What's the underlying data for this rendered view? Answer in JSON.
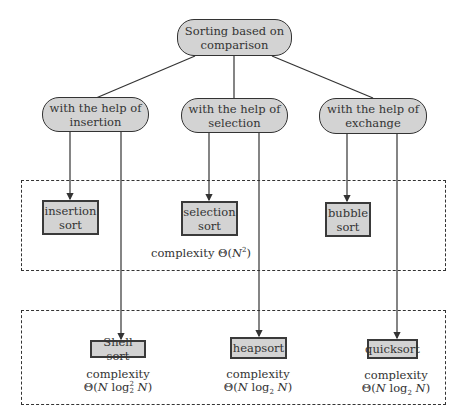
{
  "diagram": {
    "root": {
      "label_line1": "Sorting based on",
      "label_line2": "comparison"
    },
    "categories": [
      {
        "label_line1": "with the help of",
        "label_line2": "insertion"
      },
      {
        "label_line1": "with the help of",
        "label_line2": "selection"
      },
      {
        "label_line1": "with the help of",
        "label_line2": "exchange"
      }
    ],
    "quadratic_group": {
      "algorithms": [
        {
          "label_line1": "insertion",
          "label_line2": "sort"
        },
        {
          "label_line1": "selection",
          "label_line2": "sort"
        },
        {
          "label_line1": "bubble",
          "label_line2": "sort"
        }
      ],
      "complexity_word": "complexity",
      "complexity_theta": "Θ(",
      "complexity_var": "N",
      "complexity_exp": "2",
      "complexity_close": ")"
    },
    "fast_group": {
      "algorithms": [
        {
          "label": "Shell sort",
          "complexity_word": "complexity",
          "theta": "Θ(",
          "n1": "N",
          "log": " log",
          "log_sup": "2",
          "log_sub": "2",
          "n2": " N",
          "close": ")"
        },
        {
          "label": "heapsort",
          "complexity_word": "complexity",
          "theta": "Θ(",
          "n1": "N",
          "log": " log",
          "log_sup": "",
          "log_sub": "2",
          "n2": " N",
          "close": ")"
        },
        {
          "label": "quicksort",
          "complexity_word": "complexity",
          "theta": "Θ(",
          "n1": "N",
          "log": " log",
          "log_sup": "",
          "log_sub": "2",
          "n2": " N",
          "close": ")"
        }
      ]
    },
    "colors": {
      "node_fill": "#d3d3d3",
      "stroke": "#333333",
      "background": "#ffffff"
    }
  }
}
